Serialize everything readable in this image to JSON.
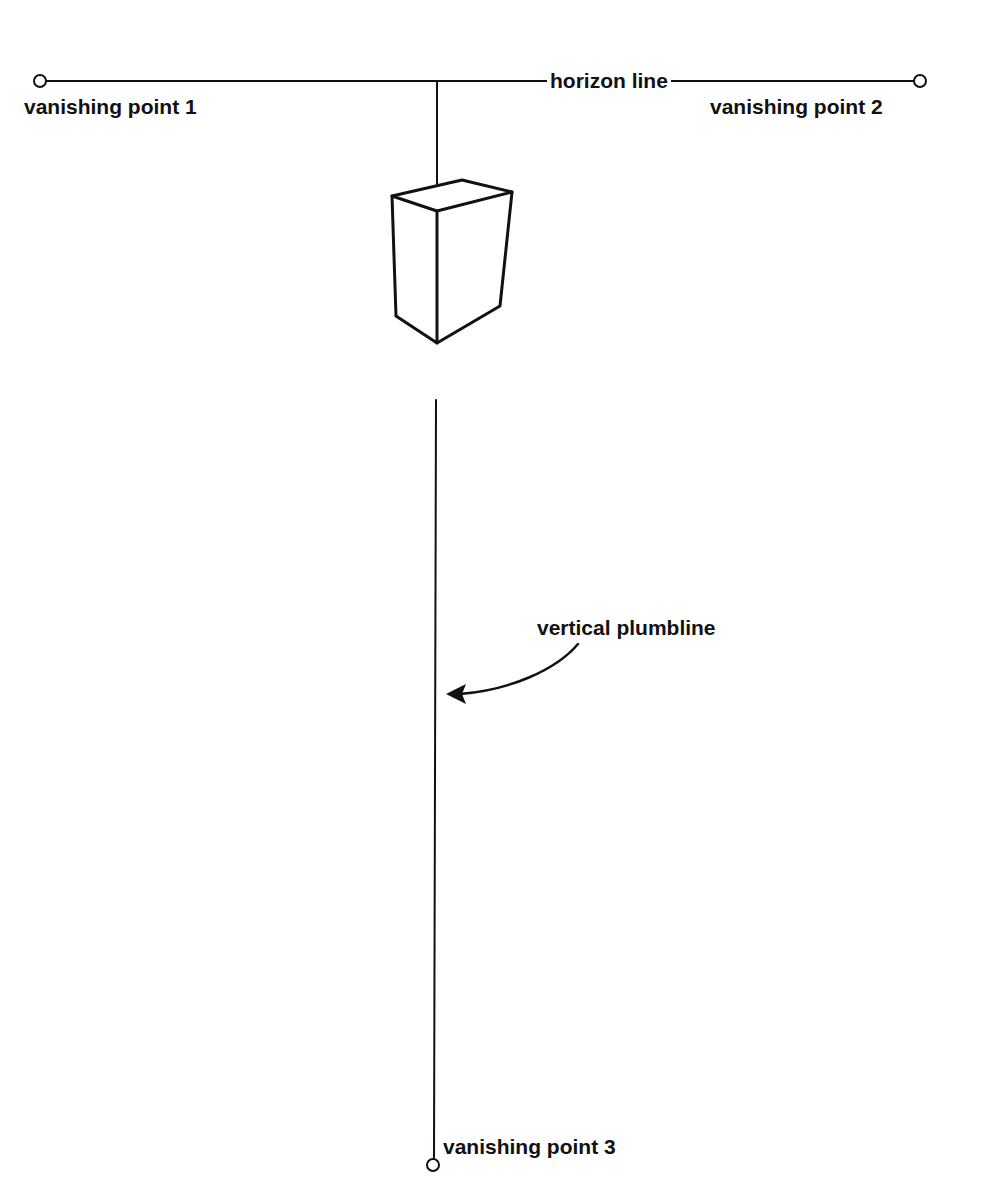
{
  "diagram": {
    "labels": {
      "horizon_line": "horizon line",
      "vanishing_point_1": "vanishing point 1",
      "vanishing_point_2": "vanishing point 2",
      "vanishing_point_3": "vanishing point 3",
      "vertical_plumbline": "vertical plumbline"
    },
    "colors": {
      "ink": "#111111",
      "background": "#ffffff"
    },
    "elements": [
      {
        "name": "horizon line",
        "type": "line",
        "from": "vanishing point 1",
        "to": "vanishing point 2"
      },
      {
        "name": "vertical plumbline",
        "type": "line",
        "from": "horizon line",
        "to": "vanishing point 3"
      },
      {
        "name": "box",
        "type": "3d-rectangular-prism",
        "position": "on plumbline below horizon"
      },
      {
        "name": "arrow",
        "type": "curved-arrow",
        "from": "vertical plumbline label",
        "to": "vertical plumbline"
      }
    ]
  }
}
